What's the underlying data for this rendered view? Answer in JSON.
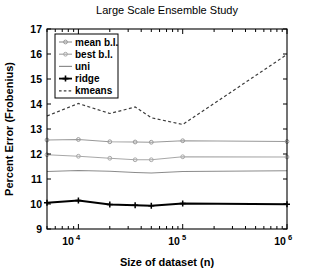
{
  "chart_data": {
    "type": "line",
    "title": "Large Scale Ensemble Study",
    "xlabel": "Size of dataset (n)",
    "ylabel": "Percent Error (Frobenius)",
    "xscale": "log",
    "yscale": "linear",
    "xlim": [
      5000,
      1000000
    ],
    "ylim": [
      9,
      17
    ],
    "grid": false,
    "legend_position": "upper left",
    "x": [
      5000,
      10000,
      20000,
      35000,
      50000,
      100000,
      1000000
    ],
    "xticks": [
      10000,
      100000,
      1000000
    ],
    "xticklabels": [
      "10^4",
      "10^5",
      "10^6"
    ],
    "yticks": [
      9,
      10,
      11,
      12,
      13,
      14,
      15,
      16,
      17
    ],
    "yticklabels": [
      "9",
      "10",
      "11",
      "12",
      "13",
      "14",
      "15",
      "16",
      "17"
    ],
    "series": [
      {
        "name": "mean b.l.",
        "color": "#999999",
        "style": "solid",
        "marker": "circle",
        "values": [
          12.56,
          12.58,
          12.49,
          12.48,
          12.47,
          12.53,
          12.5
        ]
      },
      {
        "name": "best b.l.",
        "color": "#a8a8a8",
        "style": "solid",
        "marker": "circle",
        "values": [
          11.97,
          11.91,
          11.83,
          11.77,
          11.77,
          11.89,
          11.88
        ]
      },
      {
        "name": "uni",
        "color": "#8c8c8c",
        "style": "solid",
        "marker": "none",
        "values": [
          11.3,
          11.34,
          11.31,
          11.26,
          11.24,
          11.3,
          11.33
        ]
      },
      {
        "name": "ridge",
        "color": "#000000",
        "style": "solid",
        "marker": "plus",
        "values": [
          10.05,
          10.14,
          9.98,
          9.95,
          9.93,
          10.02,
          9.99
        ]
      },
      {
        "name": "kmeans",
        "color": "#3c3c3c",
        "style": "dashed",
        "marker": "none",
        "values": [
          13.52,
          14.02,
          13.62,
          13.88,
          13.45,
          13.18,
          15.98
        ]
      }
    ]
  },
  "legend": {
    "entries": [
      {
        "label": "mean b.l."
      },
      {
        "label": "best b.l."
      },
      {
        "label": "uni"
      },
      {
        "label": "ridge"
      },
      {
        "label": "kmeans"
      }
    ]
  },
  "axis_labels": {
    "y_title": "Percent Error (Frobenius)",
    "x_title": "Size of dataset (n)",
    "x_tick_bases": [
      "10",
      "10",
      "10"
    ],
    "x_tick_exponents": [
      "4",
      "5",
      "6"
    ]
  }
}
